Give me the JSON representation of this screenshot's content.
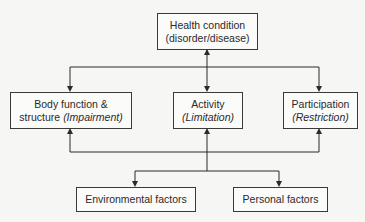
{
  "diagram": {
    "nodes": {
      "health": {
        "line1": "Health condition",
        "line2": "(disorder/disease)"
      },
      "body": {
        "line1": "Body function &",
        "line2_plain": "structure ",
        "line2_italic": "(Impairment)"
      },
      "activity": {
        "line1": "Activity",
        "line2_italic": "(Limitation)"
      },
      "participation": {
        "line1": "Participation",
        "line2_italic": "(Restriction)"
      },
      "environmental": {
        "label": "Environmental factors"
      },
      "personal": {
        "label": "Personal factors"
      }
    },
    "edges": [
      {
        "from": "health",
        "to": "body",
        "bidirectional": true
      },
      {
        "from": "health",
        "to": "activity",
        "bidirectional": true
      },
      {
        "from": "health",
        "to": "participation",
        "bidirectional": true
      },
      {
        "from": "body",
        "to": "environmental",
        "bidirectional": true
      },
      {
        "from": "activity",
        "to": "environmental",
        "bidirectional": true
      },
      {
        "from": "participation",
        "to": "personal",
        "bidirectional": true
      }
    ],
    "colors": {
      "line": "#2a2a2a",
      "background": "#f6f6f4",
      "box_border": "#3a3a3a"
    }
  }
}
